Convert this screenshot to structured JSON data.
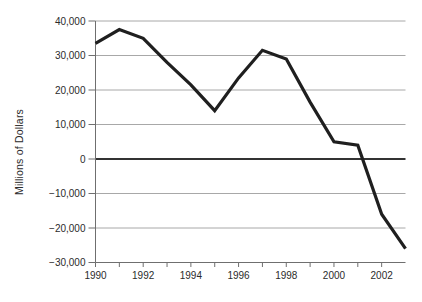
{
  "chart_data": {
    "type": "line",
    "title": "",
    "xlabel": "",
    "ylabel": "Millions of Dollars",
    "x": [
      1990,
      1991,
      1992,
      1993,
      1994,
      1995,
      1996,
      1997,
      1998,
      1999,
      2000,
      2001,
      2002,
      2003
    ],
    "values": [
      33500,
      37500,
      35000,
      28000,
      21500,
      14000,
      23500,
      31500,
      29000,
      16500,
      5000,
      4000,
      -16000,
      -26000
    ],
    "xlim": [
      1990,
      2003
    ],
    "ylim": [
      -30000,
      40000
    ],
    "y_ticks": [
      40000,
      30000,
      20000,
      10000,
      0,
      -10000,
      -20000,
      -30000
    ],
    "y_tick_labels": [
      "40,000",
      "30,000",
      "20,000",
      "10,000",
      "0",
      "−10,000",
      "−20,000",
      "−30,000"
    ],
    "x_minor_ticks": [
      1990,
      1991,
      1992,
      1993,
      1994,
      1995,
      1996,
      1997,
      1998,
      1999,
      2000,
      2001,
      2002
    ],
    "x_label_ticks": [
      1990,
      1992,
      1994,
      1996,
      1998,
      2000,
      2002
    ],
    "x_tick_labels": [
      "1990",
      "1992",
      "1994",
      "1996",
      "1998",
      "2000",
      "2002"
    ],
    "grid": "horizontal",
    "zero_line": true,
    "legend": "none",
    "colors": {
      "line": "#1f1f1f",
      "zero_line": "#333333",
      "grid": "#a8a8a8",
      "axis": "#6f6f6f",
      "text": "#2b2b2b",
      "background": "#ffffff"
    }
  }
}
